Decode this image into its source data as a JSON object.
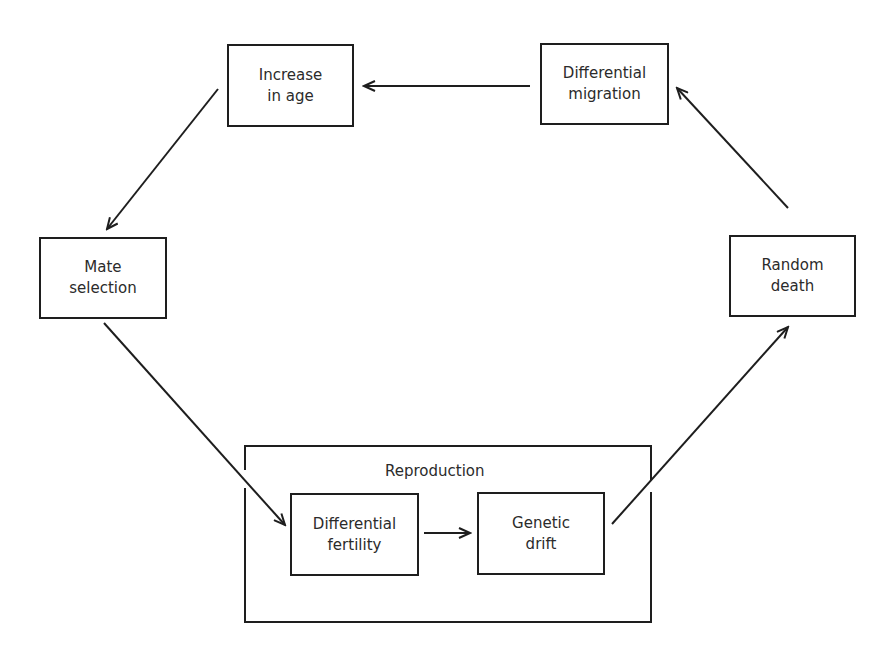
{
  "diagram": {
    "nodes": {
      "increase_in_age": {
        "line1": "Increase",
        "line2": "in age"
      },
      "differential_migration": {
        "line1": "Differential",
        "line2": "migration"
      },
      "mate_selection": {
        "line1": "Mate",
        "line2": "selection"
      },
      "random_death": {
        "line1": "Random",
        "line2": "death"
      },
      "differential_fertility": {
        "line1": "Differential",
        "line2": "fertility"
      },
      "genetic_drift": {
        "line1": "Genetic",
        "line2": "drift"
      }
    },
    "group": {
      "label": "Reproduction"
    },
    "edges": [
      {
        "from": "differential_migration",
        "to": "increase_in_age"
      },
      {
        "from": "increase_in_age",
        "to": "mate_selection"
      },
      {
        "from": "mate_selection",
        "to": "differential_fertility"
      },
      {
        "from": "differential_fertility",
        "to": "genetic_drift"
      },
      {
        "from": "genetic_drift",
        "to": "random_death"
      },
      {
        "from": "random_death",
        "to": "differential_migration"
      }
    ]
  }
}
